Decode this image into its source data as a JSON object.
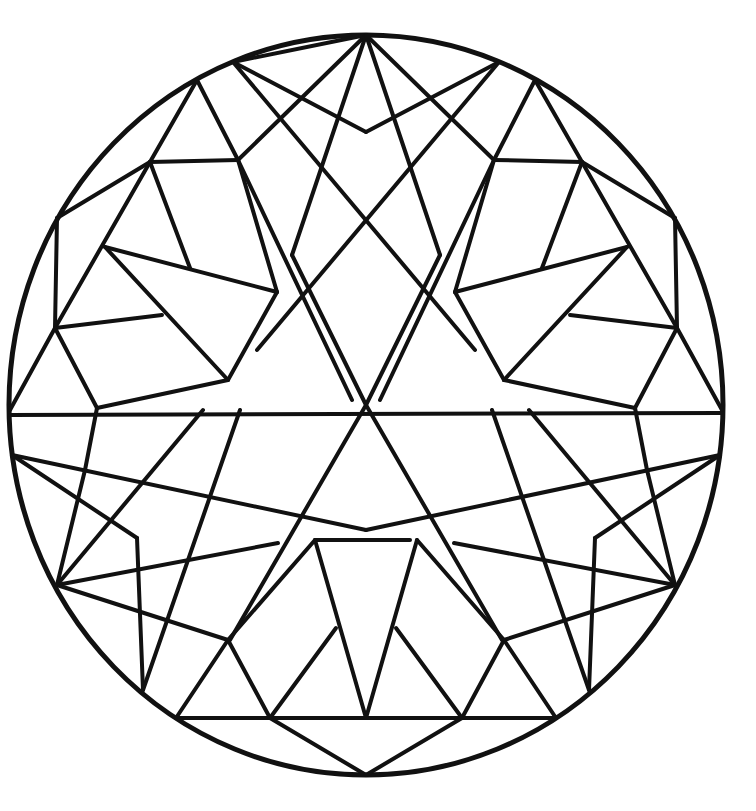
{
  "image": {
    "type": "geometric mandala coloring page",
    "stroke_color": "#111111",
    "background_color": "#ffffff"
  },
  "outline": {
    "cx": 366,
    "cy": 405,
    "rx": 357,
    "ry": 370
  },
  "lines": [
    [
      366,
      35,
      233,
      62
    ],
    [
      366,
      35,
      238,
      160
    ],
    [
      366,
      35,
      292,
      255
    ],
    [
      366,
      35,
      440,
      255
    ],
    [
      366,
      35,
      494,
      160
    ],
    [
      233,
      62,
      366,
      132
    ],
    [
      366,
      132,
      499,
      62
    ],
    [
      233,
      62,
      475,
      350
    ],
    [
      499,
      62,
      257,
      350
    ],
    [
      197,
      80,
      238,
      160
    ],
    [
      238,
      160,
      277,
      292
    ],
    [
      238,
      160,
      352,
      400
    ],
    [
      535,
      80,
      494,
      160
    ],
    [
      494,
      160,
      455,
      292
    ],
    [
      494,
      160,
      380,
      400
    ],
    [
      197,
      80,
      150,
      162
    ],
    [
      535,
      80,
      582,
      162
    ],
    [
      150,
      162,
      238,
      160
    ],
    [
      582,
      162,
      494,
      160
    ],
    [
      57,
      218,
      150,
      162
    ],
    [
      675,
      218,
      582,
      162
    ],
    [
      57,
      218,
      55,
      328
    ],
    [
      675,
      218,
      677,
      328
    ],
    [
      150,
      162,
      55,
      328
    ],
    [
      582,
      162,
      677,
      328
    ],
    [
      150,
      162,
      190,
      268
    ],
    [
      582,
      162,
      542,
      268
    ],
    [
      105,
      247,
      277,
      292
    ],
    [
      627,
      247,
      455,
      292
    ],
    [
      105,
      247,
      228,
      380
    ],
    [
      627,
      247,
      504,
      380
    ],
    [
      55,
      328,
      162,
      315
    ],
    [
      677,
      328,
      570,
      315
    ],
    [
      277,
      292,
      228,
      380
    ],
    [
      455,
      292,
      504,
      380
    ],
    [
      228,
      380,
      97,
      408
    ],
    [
      504,
      380,
      635,
      408
    ],
    [
      55,
      328,
      97,
      408
    ],
    [
      677,
      328,
      635,
      408
    ],
    [
      55,
      328,
      10,
      410
    ],
    [
      677,
      328,
      722,
      410
    ],
    [
      10,
      415,
      721,
      413
    ],
    [
      366,
      405,
      230,
      640
    ],
    [
      366,
      405,
      502,
      640
    ],
    [
      292,
      255,
      366,
      405
    ],
    [
      440,
      255,
      366,
      405
    ],
    [
      97,
      408,
      85,
      470
    ],
    [
      635,
      408,
      647,
      470
    ],
    [
      12,
      455,
      366,
      530
    ],
    [
      720,
      455,
      366,
      530
    ],
    [
      12,
      455,
      137,
      538
    ],
    [
      720,
      455,
      595,
      538
    ],
    [
      137,
      538,
      143,
      690
    ],
    [
      595,
      538,
      589,
      690
    ],
    [
      57,
      585,
      278,
      543
    ],
    [
      675,
      585,
      454,
      543
    ],
    [
      57,
      585,
      228,
      640
    ],
    [
      675,
      585,
      504,
      640
    ],
    [
      57,
      585,
      203,
      410
    ],
    [
      675,
      585,
      529,
      410
    ],
    [
      57,
      585,
      85,
      470
    ],
    [
      675,
      585,
      647,
      470
    ],
    [
      143,
      690,
      240,
      410
    ],
    [
      589,
      690,
      492,
      410
    ],
    [
      176,
      718,
      228,
      640
    ],
    [
      556,
      718,
      504,
      640
    ],
    [
      228,
      640,
      270,
      718
    ],
    [
      504,
      640,
      462,
      718
    ],
    [
      228,
      640,
      315,
      540
    ],
    [
      504,
      640,
      417,
      540
    ],
    [
      315,
      540,
      410,
      540
    ],
    [
      315,
      540,
      366,
      718
    ],
    [
      417,
      540,
      366,
      718
    ],
    [
      270,
      718,
      336,
      628
    ],
    [
      462,
      718,
      396,
      628
    ],
    [
      176,
      718,
      556,
      718
    ],
    [
      270,
      718,
      366,
      775
    ],
    [
      462,
      718,
      366,
      775
    ]
  ]
}
